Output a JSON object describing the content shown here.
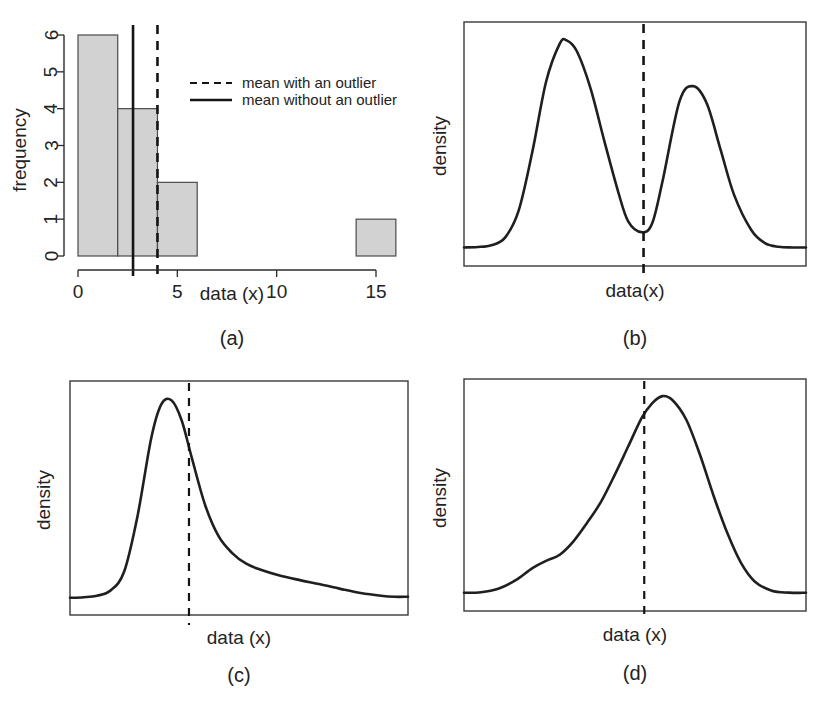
{
  "figure": {
    "panel_captions": [
      "(a)",
      "(b)",
      "(c)",
      "(d)"
    ]
  },
  "chart_data": [
    {
      "id": "a",
      "type": "bar",
      "title": "",
      "caption": "(a)",
      "xlabel": "data (x)",
      "ylabel": "frequency",
      "xlim": [
        0,
        16
      ],
      "ylim": [
        0,
        6
      ],
      "xticks": [
        0,
        5,
        10,
        15
      ],
      "xticklabels": [
        "0",
        "5",
        "10",
        "15"
      ],
      "yticks": [
        0,
        1,
        2,
        3,
        4,
        5,
        6
      ],
      "yticklabels": [
        "0",
        "1",
        "2",
        "3",
        "4",
        "5",
        "6"
      ],
      "grid": false,
      "bin_width": 2,
      "bins": [
        {
          "x0": 0,
          "x1": 2,
          "frequency": 6
        },
        {
          "x0": 2,
          "x1": 4,
          "frequency": 4
        },
        {
          "x0": 4,
          "x1": 6,
          "frequency": 2
        },
        {
          "x0": 14,
          "x1": 16,
          "frequency": 1
        }
      ],
      "bar_fill": "#d2d2d2",
      "bar_edge": "#4a4a4a",
      "annotations": [
        {
          "name": "mean-with-outlier",
          "style": "dashed",
          "x": 4.0
        },
        {
          "name": "mean-without-outlier",
          "style": "solid",
          "x": 2.77
        }
      ],
      "legend": {
        "position": "upper-right-inside",
        "entries": [
          {
            "label": "mean with an outlier",
            "style": "dashed"
          },
          {
            "label": "mean without an outlier",
            "style": "solid"
          }
        ]
      }
    },
    {
      "id": "b",
      "type": "line",
      "title": "",
      "caption": "(b)",
      "xlabel": "data(x)",
      "ylabel": "density",
      "grid": false,
      "box": true,
      "description": "bimodal density; mean falls in the valley between the two modes",
      "x": [
        0.0,
        0.04,
        0.08,
        0.12,
        0.16,
        0.2,
        0.24,
        0.28,
        0.3,
        0.33,
        0.37,
        0.41,
        0.45,
        0.48,
        0.52,
        0.55,
        0.58,
        0.63,
        0.67,
        0.71,
        0.75,
        0.79,
        0.84,
        0.88,
        0.92,
        0.96,
        1.0
      ],
      "y": [
        0.03,
        0.032,
        0.04,
        0.075,
        0.2,
        0.47,
        0.79,
        0.965,
        0.98,
        0.93,
        0.76,
        0.52,
        0.29,
        0.15,
        0.1,
        0.14,
        0.33,
        0.7,
        0.77,
        0.69,
        0.48,
        0.27,
        0.11,
        0.05,
        0.033,
        0.03,
        0.03
      ],
      "peaks": [
        {
          "x": 0.3,
          "y": 0.98,
          "label": "primary mode"
        },
        {
          "x": 0.63,
          "y": 0.77,
          "label": "secondary mode"
        }
      ],
      "valley": {
        "x": 0.525,
        "y": 0.1
      },
      "annotations": [
        {
          "name": "mean-line",
          "style": "dashed",
          "x": 0.525
        }
      ]
    },
    {
      "id": "c",
      "type": "line",
      "title": "",
      "caption": "(c)",
      "xlabel": "data (x)",
      "ylabel": "density",
      "grid": false,
      "box": true,
      "description": "right-skewed density with a long right tail; mean lies to the right of the mode",
      "x": [
        0.0,
        0.04,
        0.08,
        0.12,
        0.16,
        0.2,
        0.24,
        0.27,
        0.3,
        0.33,
        0.36,
        0.4,
        0.44,
        0.48,
        0.52,
        0.56,
        0.62,
        0.68,
        0.74,
        0.8,
        0.86,
        0.92,
        0.96,
        1.0
      ],
      "y": [
        0.025,
        0.028,
        0.035,
        0.06,
        0.15,
        0.42,
        0.79,
        0.955,
        0.975,
        0.88,
        0.7,
        0.47,
        0.32,
        0.24,
        0.19,
        0.162,
        0.132,
        0.11,
        0.09,
        0.068,
        0.048,
        0.035,
        0.03,
        0.03
      ],
      "peaks": [
        {
          "x": 0.295,
          "y": 0.975,
          "label": "mode"
        }
      ],
      "annotations": [
        {
          "name": "mean-line",
          "style": "dashed",
          "x": 0.352
        }
      ]
    },
    {
      "id": "d",
      "type": "line",
      "title": "",
      "caption": "(d)",
      "xlabel": "data (x)",
      "ylabel": "density",
      "grid": false,
      "box": true,
      "description": "left-skewed density with a shoulder on the left tail; mean lies to the left of the mode",
      "x": [
        0.0,
        0.05,
        0.1,
        0.15,
        0.2,
        0.24,
        0.28,
        0.32,
        0.36,
        0.4,
        0.44,
        0.48,
        0.52,
        0.55,
        0.58,
        0.61,
        0.65,
        0.69,
        0.73,
        0.77,
        0.81,
        0.85,
        0.9,
        0.95,
        1.0
      ],
      "y": [
        0.03,
        0.033,
        0.05,
        0.09,
        0.15,
        0.185,
        0.215,
        0.28,
        0.37,
        0.47,
        0.6,
        0.74,
        0.88,
        0.95,
        0.985,
        0.965,
        0.87,
        0.7,
        0.5,
        0.32,
        0.175,
        0.085,
        0.04,
        0.031,
        0.03
      ],
      "peaks": [
        {
          "x": 0.58,
          "y": 0.985,
          "label": "mode"
        }
      ],
      "shoulder": {
        "x": 0.255,
        "y": 0.2,
        "label": "left-tail shoulder"
      },
      "annotations": [
        {
          "name": "mean-line",
          "style": "dashed",
          "x": 0.527
        }
      ]
    }
  ]
}
